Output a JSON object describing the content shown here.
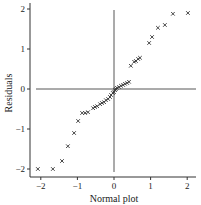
{
  "chart_data": {
    "type": "scatter",
    "title": "",
    "xlabel": "Normal plot",
    "ylabel": "Residuals",
    "xlim": [
      -2.3,
      2.3
    ],
    "ylim": [
      -2.2,
      2.1
    ],
    "xticks": [
      -2,
      -1,
      0,
      1,
      2
    ],
    "yticks": [
      -2,
      -1,
      0,
      1,
      2
    ],
    "xtick_labels": [
      "−2",
      "−1",
      "0",
      "1",
      "2"
    ],
    "ytick_labels": [
      "−2",
      "−1",
      "0",
      "1",
      "2"
    ],
    "grid": false,
    "legend": null,
    "marker": "x",
    "reference_lines": [
      {
        "orientation": "horizontal",
        "at": 0
      },
      {
        "orientation": "vertical",
        "at": 0
      }
    ],
    "series": [
      {
        "name": "residuals",
        "points": [
          [
            -2.08,
            -2.0
          ],
          [
            -1.67,
            -2.0
          ],
          [
            -1.42,
            -1.8
          ],
          [
            -1.26,
            -1.43
          ],
          [
            -1.09,
            -1.1
          ],
          [
            -0.98,
            -0.8
          ],
          [
            -0.87,
            -0.6
          ],
          [
            -0.79,
            -0.6
          ],
          [
            -0.71,
            -0.58
          ],
          [
            -0.57,
            -0.48
          ],
          [
            -0.52,
            -0.45
          ],
          [
            -0.46,
            -0.43
          ],
          [
            -0.38,
            -0.38
          ],
          [
            -0.33,
            -0.35
          ],
          [
            -0.27,
            -0.33
          ],
          [
            -0.22,
            -0.28
          ],
          [
            -0.16,
            -0.25
          ],
          [
            -0.11,
            -0.2
          ],
          [
            -0.08,
            -0.15
          ],
          [
            -0.03,
            -0.1
          ],
          [
            0.0,
            -0.08
          ],
          [
            0.03,
            -0.03
          ],
          [
            0.05,
            0.0
          ],
          [
            0.08,
            0.03
          ],
          [
            0.14,
            0.05
          ],
          [
            0.19,
            0.08
          ],
          [
            0.25,
            0.1
          ],
          [
            0.3,
            0.13
          ],
          [
            0.36,
            0.15
          ],
          [
            0.41,
            0.18
          ],
          [
            0.46,
            0.58
          ],
          [
            0.55,
            0.68
          ],
          [
            0.6,
            0.7
          ],
          [
            0.66,
            0.75
          ],
          [
            0.71,
            0.78
          ],
          [
            0.96,
            1.15
          ],
          [
            1.04,
            1.3
          ],
          [
            1.2,
            1.53
          ],
          [
            1.39,
            1.6
          ],
          [
            1.61,
            1.88
          ],
          [
            2.02,
            1.9
          ]
        ]
      }
    ]
  }
}
